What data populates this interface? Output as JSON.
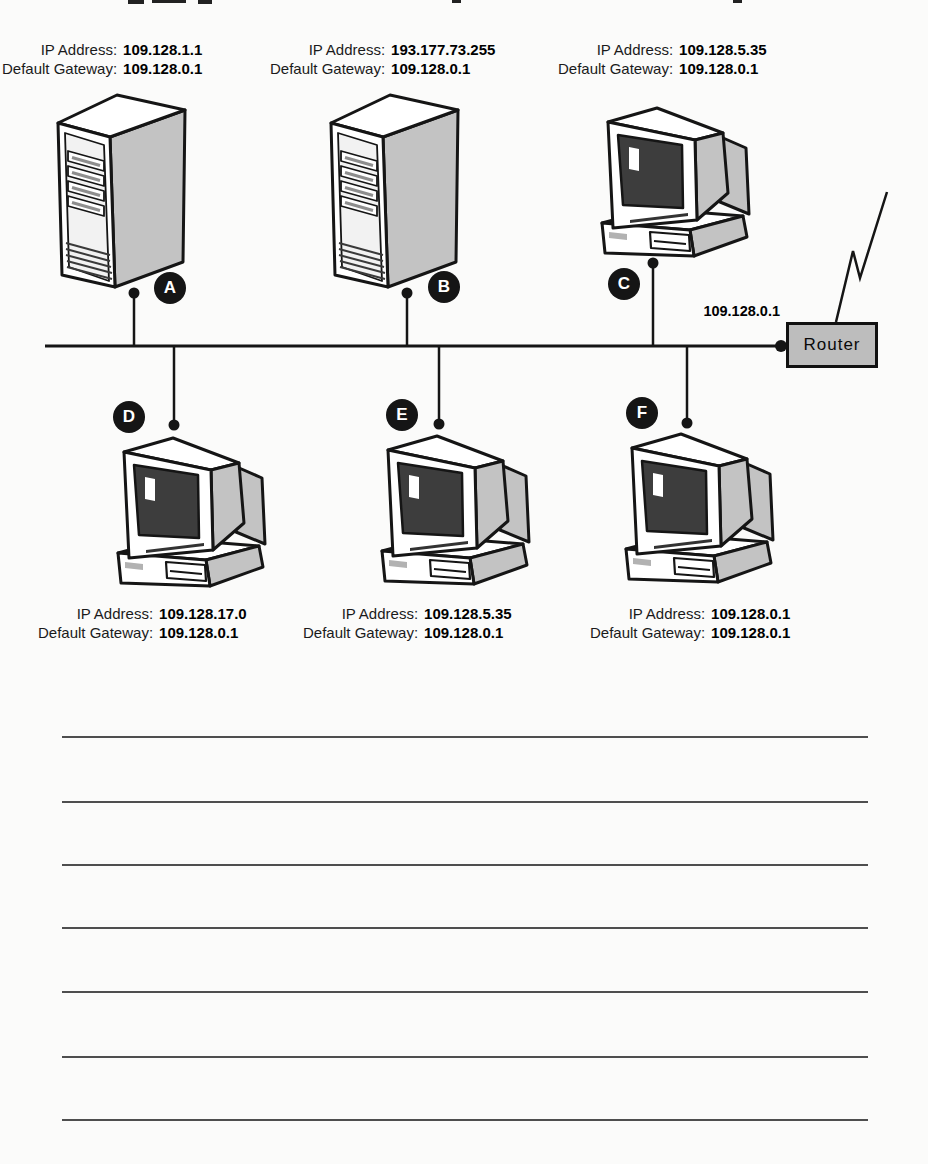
{
  "diagram": {
    "field_labels": {
      "ip": "IP Address:",
      "gateway": "Default Gateway:"
    },
    "devices": [
      {
        "letter": "A",
        "type": "server-tower",
        "ip": "109.128.1.1",
        "gateway": "109.128.0.1"
      },
      {
        "letter": "B",
        "type": "server-tower",
        "ip": "193.177.73.255",
        "gateway": "109.128.0.1"
      },
      {
        "letter": "C",
        "type": "workstation",
        "ip": "109.128.5.35",
        "gateway": "109.128.0.1"
      },
      {
        "letter": "D",
        "type": "workstation",
        "ip": "109.128.17.0",
        "gateway": "109.128.0.1"
      },
      {
        "letter": "E",
        "type": "workstation",
        "ip": "109.128.5.35",
        "gateway": "109.128.0.1"
      },
      {
        "letter": "F",
        "type": "workstation",
        "ip": "109.128.0.1",
        "gateway": "109.128.0.1"
      }
    ],
    "router": {
      "name": "Router",
      "ip": "109.128.0.1"
    },
    "answer_lines": 7
  },
  "colors": {
    "device_gray": "#c3c3c3",
    "screen_dark": "#3d3d3d",
    "router_fill": "#bdbdbd",
    "line_black": "#151515",
    "rule_gray": "#4e4e4e"
  }
}
